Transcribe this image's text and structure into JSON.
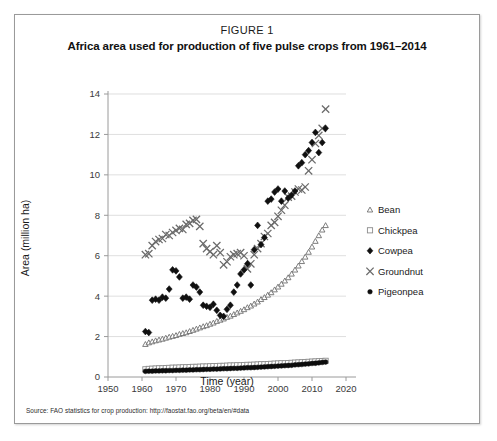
{
  "figure": {
    "number": "FIGURE 1",
    "title": "Africa area used for production of five pulse crops from 1961–2014",
    "source": "Source: FAO statistics for crop production: http://faostat.fao.org/beta/en/#data"
  },
  "chart_data": {
    "type": "scatter",
    "title": "Africa area used for production of five pulse crops from 1961–2014",
    "xlabel": "Time (year)",
    "ylabel": "Area (million ha)",
    "xlim": [
      1950,
      2020
    ],
    "ylim": [
      0,
      14
    ],
    "xticks": [
      1950,
      1960,
      1970,
      1980,
      1990,
      2000,
      2010,
      2020
    ],
    "yticks": [
      0,
      2,
      4,
      6,
      8,
      10,
      12,
      14
    ],
    "grid": "horizontal",
    "legend_position": "right",
    "x": [
      1961,
      1962,
      1963,
      1964,
      1965,
      1966,
      1967,
      1968,
      1969,
      1970,
      1971,
      1972,
      1973,
      1974,
      1975,
      1976,
      1977,
      1978,
      1979,
      1980,
      1981,
      1982,
      1983,
      1984,
      1985,
      1986,
      1987,
      1988,
      1989,
      1990,
      1991,
      1992,
      1993,
      1994,
      1995,
      1996,
      1997,
      1998,
      1999,
      2000,
      2001,
      2002,
      2003,
      2004,
      2005,
      2006,
      2007,
      2008,
      2009,
      2010,
      2011,
      2012,
      2013,
      2014
    ],
    "series": [
      {
        "name": "Bean",
        "marker": "triangle",
        "color": "#6f6f6f",
        "values": [
          1.62,
          1.7,
          1.75,
          1.8,
          1.84,
          1.88,
          1.93,
          1.98,
          2.02,
          2.06,
          2.12,
          2.16,
          2.2,
          2.26,
          2.32,
          2.38,
          2.44,
          2.5,
          2.55,
          2.62,
          2.68,
          2.76,
          2.82,
          2.88,
          2.96,
          3.02,
          3.1,
          3.18,
          3.26,
          3.34,
          3.44,
          3.52,
          3.62,
          3.72,
          3.84,
          3.94,
          4.06,
          4.18,
          4.32,
          4.46,
          4.6,
          4.76,
          4.92,
          5.1,
          5.3,
          5.5,
          5.72,
          5.94,
          6.18,
          6.44,
          6.72,
          7.0,
          7.28,
          7.5
        ]
      },
      {
        "name": "Chickpea",
        "marker": "square",
        "color": "#8c8c8c",
        "values": [
          0.38,
          0.4,
          0.41,
          0.42,
          0.43,
          0.43,
          0.44,
          0.45,
          0.46,
          0.46,
          0.47,
          0.48,
          0.48,
          0.49,
          0.5,
          0.5,
          0.51,
          0.52,
          0.52,
          0.53,
          0.54,
          0.54,
          0.55,
          0.55,
          0.56,
          0.57,
          0.57,
          0.58,
          0.58,
          0.59,
          0.6,
          0.6,
          0.61,
          0.62,
          0.63,
          0.63,
          0.64,
          0.65,
          0.66,
          0.67,
          0.68,
          0.68,
          0.69,
          0.7,
          0.71,
          0.72,
          0.73,
          0.74,
          0.75,
          0.76,
          0.77,
          0.78,
          0.79,
          0.8
        ]
      },
      {
        "name": "Cowpea",
        "marker": "diamond",
        "color": "#101010",
        "values": [
          2.25,
          2.2,
          3.8,
          3.85,
          3.8,
          3.95,
          3.9,
          4.35,
          5.3,
          5.25,
          4.95,
          3.9,
          3.95,
          3.85,
          4.55,
          4.45,
          4.2,
          3.55,
          3.5,
          3.45,
          3.6,
          3.3,
          3.05,
          3.0,
          3.35,
          3.55,
          4.2,
          4.55,
          5.1,
          5.3,
          5.6,
          4.55,
          6.3,
          7.5,
          6.55,
          6.9,
          8.7,
          8.8,
          9.15,
          9.3,
          8.7,
          9.2,
          8.85,
          9.0,
          9.2,
          10.45,
          10.6,
          11.0,
          11.2,
          11.6,
          12.1,
          11.1,
          11.6,
          12.3
        ]
      },
      {
        "name": "Groundnut",
        "marker": "cross",
        "color": "#6a6a6a",
        "values": [
          6.05,
          6.1,
          6.5,
          6.7,
          6.8,
          6.85,
          7.05,
          7.0,
          7.15,
          7.25,
          7.35,
          7.3,
          7.55,
          7.6,
          7.75,
          7.8,
          7.45,
          6.6,
          6.35,
          6.2,
          6.05,
          6.5,
          6.15,
          5.55,
          5.7,
          5.95,
          6.05,
          6.1,
          6.15,
          6.0,
          5.35,
          5.6,
          6.05,
          6.35,
          6.6,
          6.95,
          7.1,
          7.5,
          7.65,
          7.95,
          8.25,
          8.5,
          8.9,
          8.95,
          9.15,
          9.3,
          9.25,
          9.4,
          10.2,
          10.75,
          11.55,
          11.95,
          12.3,
          13.25
        ]
      },
      {
        "name": "Pigeonpea",
        "marker": "circle",
        "color": "#0d0d0d",
        "values": [
          0.28,
          0.29,
          0.29,
          0.3,
          0.3,
          0.31,
          0.31,
          0.32,
          0.32,
          0.33,
          0.33,
          0.34,
          0.34,
          0.35,
          0.35,
          0.36,
          0.36,
          0.37,
          0.38,
          0.38,
          0.39,
          0.39,
          0.4,
          0.41,
          0.41,
          0.42,
          0.43,
          0.43,
          0.44,
          0.45,
          0.46,
          0.46,
          0.47,
          0.48,
          0.49,
          0.5,
          0.51,
          0.52,
          0.53,
          0.54,
          0.55,
          0.56,
          0.57,
          0.58,
          0.6,
          0.61,
          0.62,
          0.64,
          0.65,
          0.67,
          0.68,
          0.7,
          0.72,
          0.74
        ]
      }
    ]
  },
  "legend": {
    "items": [
      {
        "label": "Bean"
      },
      {
        "label": "Chickpea"
      },
      {
        "label": "Cowpea"
      },
      {
        "label": "Groundnut"
      },
      {
        "label": "Pigeonpea"
      }
    ]
  }
}
